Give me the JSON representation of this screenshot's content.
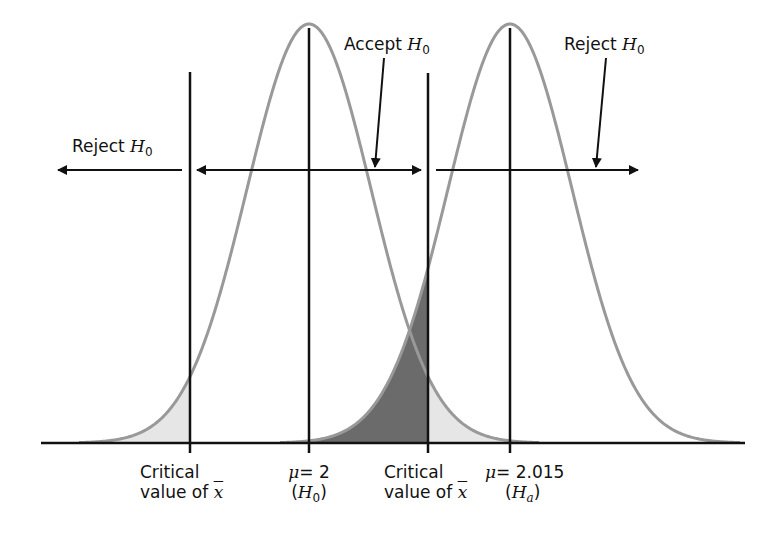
{
  "labels": {
    "reject_left": "Reject",
    "accept": "Accept",
    "reject_right": "Reject",
    "hypothesis_null_symbol": "H",
    "hypothesis_null_sub": "0",
    "critical_line1": "Critical",
    "critical_line2": "value of",
    "xbar": "x",
    "mu_symbol": "μ",
    "mu_null": "= 2",
    "mu_alt": "= 2.015",
    "null_paren_open": "(",
    "null_paren_close": ")",
    "alt_sub": "a"
  },
  "curves": [
    {
      "name": "H0 distribution",
      "mean_label": "μ = 2",
      "center_px": 309
    },
    {
      "name": "Ha distribution",
      "mean_label": "μ = 2.015",
      "center_px": 510
    }
  ],
  "colors": {
    "curve": "#999999",
    "line": "#111111",
    "beta_fill": "#6b6b6b",
    "alpha_fill": "#e6e6e6"
  }
}
